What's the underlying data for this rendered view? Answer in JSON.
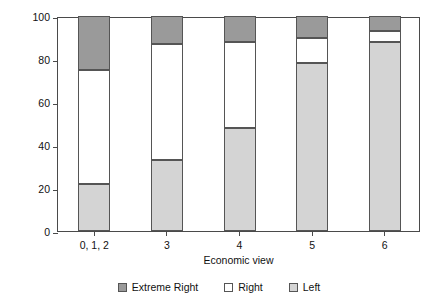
{
  "chart_data": {
    "type": "bar",
    "subtype": "stacked-bar-100",
    "title": "",
    "xlabel": "Economic view",
    "ylabel": "Percentage",
    "categories": [
      "0, 1, 2",
      "3",
      "4",
      "5",
      "6"
    ],
    "series": [
      {
        "name": "Left",
        "color": "#d4d4d4",
        "values": [
          22,
          33,
          48,
          78,
          88
        ]
      },
      {
        "name": "Right",
        "color": "#ffffff",
        "values": [
          53,
          54,
          40,
          12,
          5
        ]
      },
      {
        "name": "Extreme Right",
        "color": "#9a9a9a",
        "values": [
          25,
          13,
          12,
          10,
          7
        ]
      }
    ],
    "stack_order_bottom_to_top": [
      "Left",
      "Right",
      "Extreme Right"
    ],
    "ylim": [
      0,
      100
    ],
    "yticks": [
      0,
      20,
      40,
      60,
      80,
      100
    ],
    "ytick_labels": [
      "0",
      "20",
      "40",
      "60",
      "80",
      "100"
    ],
    "grid": false,
    "legend_position": "bottom-center",
    "legend": [
      {
        "label": "Extreme Right",
        "color": "#9a9a9a"
      },
      {
        "label": "Right",
        "color": "#ffffff"
      },
      {
        "label": "Left",
        "color": "#d4d4d4"
      }
    ],
    "axis_color": "#4a4a4a",
    "background": "#ffffff"
  }
}
